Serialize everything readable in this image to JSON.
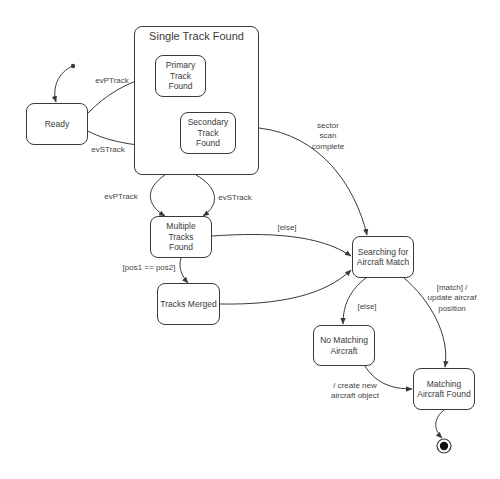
{
  "diagram": {
    "type": "UML state machine",
    "composite": {
      "id": "single_track_found",
      "title": "Single Track Found"
    },
    "states": {
      "ready": "Ready",
      "primary": "Primary\nTrack\nFound",
      "secondary": "Secondary\nTrack\nFound",
      "multiple": "Multiple\nTracks\nFound",
      "merged": "Tracks Merged",
      "searching": "Searching for\nAircraft Match",
      "no_match": "No Matching\nAircraft",
      "match_found": "Matching\nAircraft Found"
    },
    "pseudostates": {
      "initial": "initial-state",
      "final": "final-state"
    },
    "transitions": {
      "init_to_ready": "",
      "ready_to_primary": "evPTrack",
      "ready_to_secondary": "evSTrack",
      "composite_to_multiple_p": "evPTrack",
      "composite_to_multiple_s": "evSTrack",
      "composite_to_searching": "sector\nscan\ncomplete",
      "multiple_to_searching": "[else]",
      "multiple_to_merged": "[pos1 == pos2]",
      "merged_to_searching": "",
      "searching_to_no_match": "[else]",
      "searching_to_match": "[match] /\nupdate aircraf\nposition",
      "no_match_to_match": "/ create new\naircraft object",
      "match_to_final": ""
    },
    "colors": {
      "line": "#3a3a3a",
      "text": "#444444",
      "background": "#ffffff"
    }
  }
}
